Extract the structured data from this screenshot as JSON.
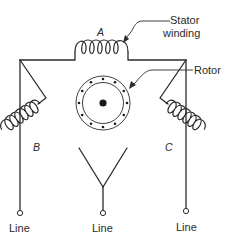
{
  "diagram": {
    "type": "three-phase delta-connected stator winding schematic",
    "labels": {
      "stator_line1": "Stator",
      "stator_line2": "winding",
      "rotor": "Rotor",
      "coil_a": "A",
      "coil_b": "B",
      "coil_c": "C",
      "line_left": "Line",
      "line_center": "Line",
      "line_right": "Line"
    },
    "components": [
      {
        "id": "coil-a",
        "label": "A",
        "kind": "winding"
      },
      {
        "id": "coil-b",
        "label": "B",
        "kind": "winding"
      },
      {
        "id": "coil-c",
        "label": "C",
        "kind": "winding"
      },
      {
        "id": "rotor",
        "label": "Rotor",
        "kind": "rotor",
        "slot_dots": 12
      },
      {
        "id": "terminal-left",
        "label": "Line",
        "kind": "terminal"
      },
      {
        "id": "terminal-center",
        "label": "Line",
        "kind": "terminal"
      },
      {
        "id": "terminal-right",
        "label": "Line",
        "kind": "terminal"
      }
    ],
    "colors": {
      "ink": "#2a2a2a",
      "background": "#ffffff"
    }
  }
}
